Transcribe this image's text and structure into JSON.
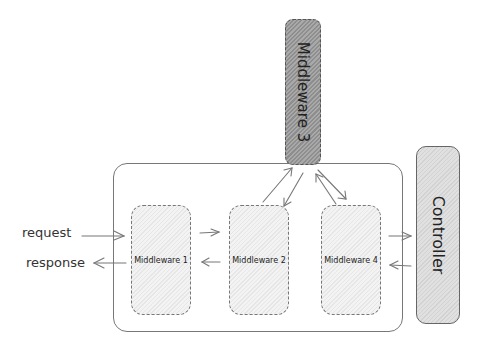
{
  "diagram": {
    "title": "",
    "nodes": {
      "middleware1": {
        "label": "Middleware 1"
      },
      "middleware2": {
        "label": "Middleware 2"
      },
      "middleware3": {
        "label": "Middleware 3"
      },
      "middleware4": {
        "label": "Middleware 4"
      },
      "controller": {
        "label": "Controller"
      }
    },
    "side_labels": {
      "request": "request",
      "response": "response"
    },
    "edges": [
      {
        "from": "request",
        "to": "middleware1"
      },
      {
        "from": "middleware1",
        "to": "response"
      },
      {
        "from": "middleware1",
        "to": "middleware2"
      },
      {
        "from": "middleware2",
        "to": "middleware1"
      },
      {
        "from": "middleware2",
        "to": "middleware3"
      },
      {
        "from": "middleware3",
        "to": "middleware2"
      },
      {
        "from": "middleware3",
        "to": "middleware4"
      },
      {
        "from": "middleware4",
        "to": "middleware3"
      },
      {
        "from": "middleware4",
        "to": "controller"
      },
      {
        "from": "controller",
        "to": "middleware4"
      }
    ],
    "colors": {
      "stroke": "#777777",
      "middleware_fill": "#eeeeee",
      "middleware3_fill": "#9c9c9c",
      "controller_fill": "#d9d9d9"
    }
  }
}
